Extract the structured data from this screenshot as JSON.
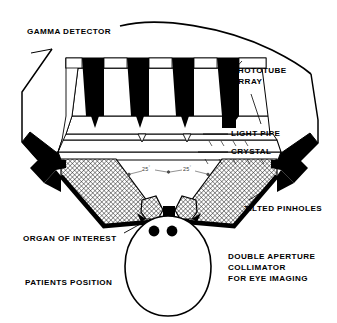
{
  "figure": {
    "background_color": "#ffffff",
    "ink_color": "#000000",
    "width": 337,
    "height": 323
  },
  "labels": {
    "gamma_detector": "GAMMA DETECTOR",
    "phototube_line1": "PHOTOTUBE",
    "phototube_line2": "ARRAY",
    "light_pipe": "LIGHT PIPE",
    "crystal": "CRYSTAL",
    "tilted_pinholes": "TILTED PINHOLES",
    "organ_of_interest": "ORGAN OF INTEREST",
    "patients_position": "PATIENTS POSITION",
    "collimator_line1": "DOUBLE APERTURE",
    "collimator_line2": "COLLIMATOR",
    "collimator_line3": "FOR EYE IMAGING"
  },
  "angles": {
    "left": "25",
    "right": "25",
    "unit": "°"
  },
  "components": {
    "phototube_count": 4,
    "eye_count": 2
  }
}
